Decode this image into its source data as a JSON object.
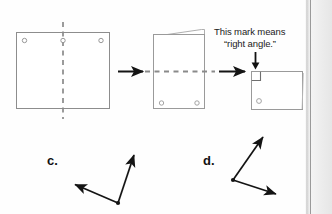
{
  "page": {
    "background_color": "#fefefe",
    "ink_color": "#6f6f6f",
    "dark_ink_color": "#1a1a1a"
  },
  "annotation": {
    "line1": "This mark means",
    "line2": "“right angle.”",
    "pointer": "down-arrow"
  },
  "diagram": {
    "steps": [
      {
        "name": "unfolded-sheet",
        "description": "Square sheet of paper with three punched holes along the top and a vertical dashed fold line through the middle",
        "holes": 3,
        "fold_line": "vertical-dashed"
      },
      {
        "name": "folded-once",
        "description": "Sheet folded in half vertically with a flap showing at the top, two holes near the bottom, and a horizontal dashed fold line",
        "holes": 2,
        "fold_line": "horizontal-dashed"
      },
      {
        "name": "folded-twice",
        "description": "Sheet folded twice forming a rectangle with a right angle mark in the upper left corner and one hole near the lower left",
        "holes": 1,
        "right_angle_mark": true
      }
    ],
    "arrows": 2
  },
  "problems": [
    {
      "label": "c.",
      "name": "angle-c",
      "description": "Angle with vertex at lower right, one ray pointing up and right, one ray pointing left",
      "vertex": [
        118,
        203
      ],
      "rays": [
        [
          73,
          184
        ],
        [
          135,
          153
        ]
      ]
    },
    {
      "label": "d.",
      "name": "angle-d",
      "description": "Angle with vertex at left, one ray pointing up and right, one ray pointing down and right",
      "vertex": [
        233,
        180
      ],
      "rays": [
        [
          264,
          134
        ],
        [
          278,
          196
        ]
      ]
    }
  ]
}
